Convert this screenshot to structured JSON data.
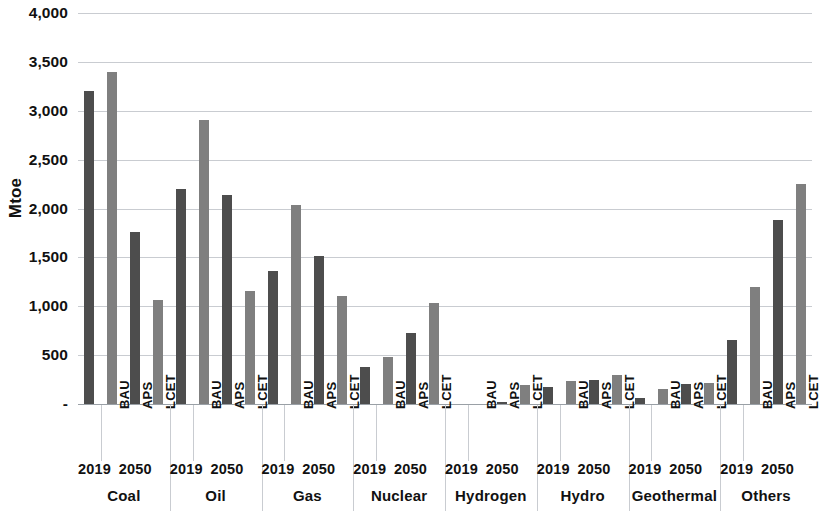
{
  "chart_data": {
    "type": "bar",
    "title": "",
    "xlabel": "",
    "ylabel": "Mtoe",
    "ylim": [
      0,
      4000
    ],
    "grid": true,
    "legend": "none",
    "y_ticks": [
      "-",
      "500",
      "1,000",
      "1,500",
      "2,000",
      "2,500",
      "3,000",
      "3,500",
      "4,000"
    ],
    "y_tick_values": [
      0,
      500,
      1000,
      1500,
      2000,
      2500,
      3000,
      3500,
      4000
    ],
    "scenario_labels": [
      "",
      "BAU",
      "APS",
      "LCET"
    ],
    "year_labels": [
      "2019",
      "2050"
    ],
    "colors": {
      "dark_bar": "#4d4d4d",
      "light_bar": "#7f7f7f",
      "gridline": "#c9ccd1",
      "axis": "#9aa0a6",
      "text": "#111111"
    },
    "categories": [
      "Coal",
      "Oil",
      "Gas",
      "Nuclear",
      "Hydrogen",
      "Hydro",
      "Geothermal",
      "Others"
    ],
    "series": [
      {
        "name": "2019",
        "shade": "dark",
        "values": [
          3200,
          2200,
          1360,
          380,
          0,
          170,
          60,
          660
        ]
      },
      {
        "name": "BAU",
        "shade": "light",
        "values": [
          3400,
          2910,
          2040,
          480,
          0,
          240,
          150,
          1200
        ]
      },
      {
        "name": "APS",
        "shade": "dark",
        "values": [
          1760,
          2140,
          1510,
          730,
          20,
          250,
          200,
          1880
        ]
      },
      {
        "name": "LCET",
        "shade": "light",
        "values": [
          1060,
          1160,
          1110,
          1030,
          190,
          300,
          210,
          2250
        ]
      }
    ]
  }
}
